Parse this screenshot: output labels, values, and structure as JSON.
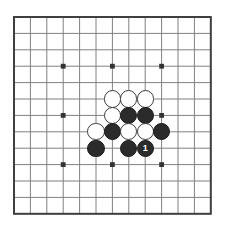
{
  "app": {
    "title": "Go Board Diagram",
    "background_color": "#ffffff"
  },
  "board": {
    "name": "go-board",
    "size": 13,
    "origin_x": 14,
    "origin_y": 17,
    "spacing": 16.4,
    "line_color": "#808080",
    "border_color": "#404040",
    "border_width": 2,
    "line_width": 1,
    "board_color": "#ffffff",
    "star_point_color": "#333333",
    "star_point_radius": 2.4,
    "star_points": [
      {
        "col": 3,
        "row": 3
      },
      {
        "col": 6,
        "row": 3
      },
      {
        "col": 9,
        "row": 3
      },
      {
        "col": 3,
        "row": 6
      },
      {
        "col": 6,
        "row": 6
      },
      {
        "col": 9,
        "row": 6
      },
      {
        "col": 3,
        "row": 9
      },
      {
        "col": 6,
        "row": 9
      },
      {
        "col": 9,
        "row": 9
      }
    ]
  },
  "stones": {
    "radius": 8.6,
    "black_color": "#2b2b2b",
    "white_color": "#ffffff",
    "items": [
      {
        "id": "w1",
        "color": "white",
        "col": 6,
        "row": 5,
        "label": ""
      },
      {
        "id": "w2",
        "color": "white",
        "col": 7,
        "row": 5,
        "label": ""
      },
      {
        "id": "w3",
        "color": "white",
        "col": 8,
        "row": 5,
        "label": ""
      },
      {
        "id": "w4",
        "color": "white",
        "col": 6,
        "row": 6,
        "label": ""
      },
      {
        "id": "b1",
        "color": "black",
        "col": 7,
        "row": 6,
        "label": ""
      },
      {
        "id": "b2",
        "color": "black",
        "col": 8,
        "row": 6,
        "label": ""
      },
      {
        "id": "w5",
        "color": "white",
        "col": 5,
        "row": 7,
        "label": ""
      },
      {
        "id": "b3",
        "color": "black",
        "col": 6,
        "row": 7,
        "label": ""
      },
      {
        "id": "w6",
        "color": "white",
        "col": 7,
        "row": 7,
        "label": ""
      },
      {
        "id": "w7",
        "color": "white",
        "col": 8,
        "row": 7,
        "label": ""
      },
      {
        "id": "b4",
        "color": "black",
        "col": 9,
        "row": 7,
        "label": ""
      },
      {
        "id": "b5",
        "color": "black",
        "col": 5,
        "row": 8,
        "label": ""
      },
      {
        "id": "b6",
        "color": "black",
        "col": 7,
        "row": 8,
        "label": ""
      },
      {
        "id": "b7",
        "color": "black",
        "col": 8,
        "row": 8,
        "label": "1"
      }
    ]
  },
  "move_marker": {
    "number": "1",
    "stone_id": "b7",
    "font_size": 9
  }
}
